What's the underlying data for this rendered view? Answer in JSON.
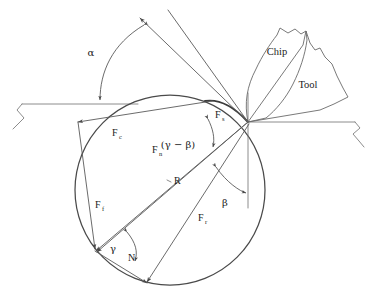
{
  "figure": {
    "background_color": "#ffffff",
    "line_color": "#5a5a5a",
    "text_color": "#1b1b1b",
    "width": 383,
    "height": 297
  },
  "labels": {
    "alpha": "α",
    "beta": "β",
    "gamma": "γ",
    "gamma_minus_beta": "(γ − β)",
    "force_cutting": "F",
    "force_cutting_sub": "c",
    "force_feed": "F",
    "force_feed_sub": "f",
    "force_shear": "F",
    "force_shear_sub": "s",
    "force_normal_shear": "F",
    "force_normal_shear_sub": "n",
    "force_friction_resultant": "F",
    "force_friction_resultant_sub": "r",
    "resultant": "R",
    "normal": "N",
    "chip": "Chip",
    "tool": "Tool"
  },
  "geometry": {
    "circle": {
      "cx": 170,
      "cy": 190,
      "r": 95
    },
    "tool_tip": {
      "x": 248,
      "y": 122
    },
    "shear_start": {
      "x": 213,
      "y": 101
    },
    "gamma_vertex": {
      "x": 95,
      "y": 250
    },
    "fc_left_end": {
      "x": 76,
      "y": 122
    },
    "fn_bottom_end": {
      "x": 148,
      "y": 283
    },
    "workpiece_surface_y": 104,
    "machined_surface_y": 122,
    "vertical_ref_x": 248
  },
  "elements": [
    {
      "name": "rake-angle-alpha",
      "label": "α",
      "kind": "angle"
    },
    {
      "name": "friction-angle-beta",
      "label": "β",
      "kind": "angle"
    },
    {
      "name": "shear-angle-gamma",
      "label": "γ",
      "kind": "angle"
    },
    {
      "name": "angle-gamma-minus-beta",
      "label": "(γ − β)",
      "kind": "angle"
    },
    {
      "name": "cutting-force",
      "label": "Fc",
      "kind": "force-vector"
    },
    {
      "name": "feed-force",
      "label": "Ff",
      "kind": "force-vector"
    },
    {
      "name": "shear-force",
      "label": "Fs",
      "kind": "force-vector"
    },
    {
      "name": "normal-shear-force",
      "label": "Fn",
      "kind": "force-vector"
    },
    {
      "name": "friction-force",
      "label": "Fr",
      "kind": "force-vector"
    },
    {
      "name": "resultant-force",
      "label": "R",
      "kind": "force-vector"
    },
    {
      "name": "normal-force",
      "label": "N",
      "kind": "force-vector"
    },
    {
      "name": "chip-body",
      "label": "Chip",
      "kind": "workpiece-part"
    },
    {
      "name": "tool-body",
      "label": "Tool",
      "kind": "workpiece-part"
    }
  ]
}
